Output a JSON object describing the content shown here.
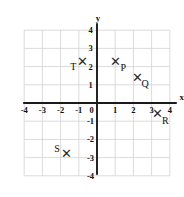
{
  "chart_data": {
    "type": "scatter",
    "title": "",
    "xlabel": "x",
    "ylabel": "y",
    "xlim": [
      -4,
      4
    ],
    "ylim": [
      -4,
      4
    ],
    "grid": true,
    "legend": "none",
    "x_ticks": [
      "-4",
      "-3",
      "-2",
      "-1",
      "0",
      "1",
      "2",
      "3",
      "4"
    ],
    "y_ticks": [
      "4",
      "3",
      "2",
      "1",
      "0",
      "-1",
      "-2",
      "-3",
      "-4"
    ],
    "x_tick_values": [
      -4,
      -3,
      -2,
      -1,
      0,
      1,
      2,
      3,
      4
    ],
    "y_tick_values": [
      4,
      3,
      2,
      1,
      0,
      -1,
      -2,
      -3,
      -4
    ],
    "marker": "x",
    "points": [
      {
        "label": "P",
        "x": 1.0,
        "y": 2.3,
        "label_dx": 0.45,
        "label_dy": -0.35
      },
      {
        "label": "Q",
        "x": 2.2,
        "y": 1.4,
        "label_dx": 0.45,
        "label_dy": -0.35
      },
      {
        "label": "T",
        "x": -0.8,
        "y": 2.3,
        "label_dx": -0.5,
        "label_dy": -0.3
      },
      {
        "label": "R",
        "x": 3.3,
        "y": -0.6,
        "label_dx": 0.45,
        "label_dy": -0.35
      },
      {
        "label": "S",
        "x": -1.7,
        "y": -2.8,
        "label_dx": -0.5,
        "label_dy": 0.3
      }
    ]
  },
  "colors": {
    "grid": "#d2d2d2",
    "axis": "#1a1a1a",
    "text": "#111111",
    "marker": "#2b2b2b",
    "background": "#ffffff"
  }
}
